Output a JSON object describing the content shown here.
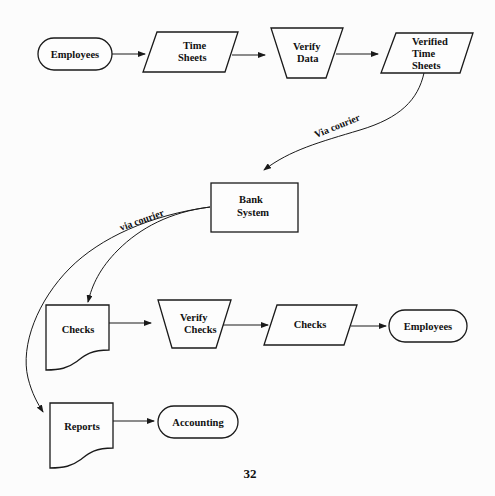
{
  "diagram": {
    "type": "flowchart",
    "nodes": {
      "employees_top": {
        "kind": "terminator",
        "lines": [
          "Employees"
        ]
      },
      "time_sheets": {
        "kind": "input-output",
        "lines": [
          "Time",
          "Sheets"
        ]
      },
      "verify_data": {
        "kind": "manual-operation",
        "lines": [
          "Verify",
          "Data"
        ]
      },
      "verified_time_sheets": {
        "kind": "input-output",
        "lines": [
          "Verified",
          "Time",
          "Sheets"
        ]
      },
      "bank_system": {
        "kind": "process",
        "lines": [
          "Bank",
          "System"
        ]
      },
      "checks_doc": {
        "kind": "document",
        "lines": [
          "Checks"
        ]
      },
      "verify_checks": {
        "kind": "manual-operation",
        "lines": [
          "Verify",
          "Checks"
        ]
      },
      "checks_io": {
        "kind": "input-output",
        "lines": [
          "Checks"
        ]
      },
      "employees_bottom": {
        "kind": "terminator",
        "lines": [
          "Employees"
        ]
      },
      "reports_doc": {
        "kind": "document",
        "lines": [
          "Reports"
        ]
      },
      "accounting": {
        "kind": "terminator",
        "lines": [
          "Accounting"
        ]
      }
    },
    "edges": [
      {
        "from": "employees_top",
        "to": "time_sheets",
        "label": ""
      },
      {
        "from": "time_sheets",
        "to": "verify_data",
        "label": ""
      },
      {
        "from": "verify_data",
        "to": "verified_time_sheets",
        "label": ""
      },
      {
        "from": "verified_time_sheets",
        "to": "bank_system",
        "label": "Via courier"
      },
      {
        "from": "bank_system",
        "to": "checks_doc",
        "label": "via courier"
      },
      {
        "from": "bank_system",
        "to": "reports_doc",
        "label": ""
      },
      {
        "from": "checks_doc",
        "to": "verify_checks",
        "label": ""
      },
      {
        "from": "verify_checks",
        "to": "checks_io",
        "label": ""
      },
      {
        "from": "checks_io",
        "to": "employees_bottom",
        "label": ""
      },
      {
        "from": "reports_doc",
        "to": "accounting",
        "label": ""
      }
    ]
  },
  "page_number": "32"
}
